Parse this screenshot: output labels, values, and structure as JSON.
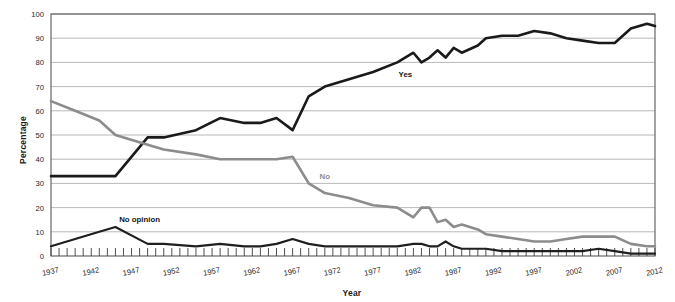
{
  "chart_data": {
    "type": "line",
    "title": "",
    "xlabel": "Year",
    "ylabel": "Percentage",
    "xlim": [
      1937,
      2012
    ],
    "ylim": [
      0,
      100
    ],
    "grid": true,
    "gridlines_axis": "y",
    "legend_position": "inline-annotations",
    "ytick_labels": [
      "0",
      "10",
      "20",
      "30",
      "40",
      "50",
      "60",
      "70",
      "80",
      "90",
      "100"
    ],
    "ytick_values": [
      0,
      10,
      20,
      30,
      40,
      50,
      60,
      70,
      80,
      90,
      100
    ],
    "xtick_labels": [
      "1937",
      "1942",
      "1947",
      "1952",
      "1957",
      "1962",
      "1967",
      "1972",
      "1977",
      "1982",
      "1987",
      "1992",
      "1997",
      "2002",
      "2007",
      "2012"
    ],
    "xtick_values": [
      1937,
      1942,
      1947,
      1952,
      1957,
      1962,
      1967,
      1972,
      1977,
      1982,
      1987,
      1992,
      1997,
      2002,
      2007,
      2012
    ],
    "minor_xticks_every": 1,
    "annotations": [
      {
        "text": "Yes",
        "x": 1981,
        "y": 74,
        "color": "#141414"
      },
      {
        "text": "No",
        "x": 1971,
        "y": 32,
        "color": "#8c8c8c"
      },
      {
        "text": "No opinion",
        "x": 1948,
        "y": 14,
        "color": "#141414"
      }
    ],
    "series": [
      {
        "name": "Yes",
        "color": "#1a1a1a",
        "width": 2.6,
        "x": [
          1937,
          1940,
          1943,
          1945,
          1949,
          1951,
          1955,
          1958,
          1961,
          1963,
          1965,
          1967,
          1969,
          1971,
          1974,
          1977,
          1980,
          1982,
          1983,
          1984,
          1985,
          1986,
          1987,
          1988,
          1990,
          1991,
          1993,
          1995,
          1997,
          1999,
          2001,
          2003,
          2005,
          2007,
          2009,
          2011,
          2012
        ],
        "values": [
          33,
          33,
          33,
          33,
          49,
          49,
          52,
          57,
          55,
          55,
          57,
          52,
          66,
          70,
          73,
          76,
          80,
          84,
          80,
          82,
          85,
          82,
          86,
          84,
          87,
          90,
          91,
          91,
          93,
          92,
          90,
          89,
          88,
          88,
          94,
          96,
          95
        ]
      },
      {
        "name": "No",
        "color": "#8c8c8c",
        "width": 2.6,
        "x": [
          1937,
          1940,
          1943,
          1945,
          1949,
          1951,
          1955,
          1958,
          1961,
          1963,
          1965,
          1967,
          1969,
          1971,
          1974,
          1977,
          1980,
          1982,
          1983,
          1984,
          1985,
          1986,
          1987,
          1988,
          1990,
          1991,
          1993,
          1995,
          1997,
          1999,
          2001,
          2003,
          2005,
          2007,
          2009,
          2011,
          2012
        ],
        "values": [
          64,
          60,
          56,
          50,
          46,
          44,
          42,
          40,
          40,
          40,
          40,
          41,
          30,
          26,
          24,
          21,
          20,
          16,
          20,
          20,
          14,
          15,
          12,
          13,
          11,
          9,
          8,
          7,
          6,
          6,
          7,
          8,
          8,
          8,
          5,
          4,
          4
        ]
      },
      {
        "name": "No opinion",
        "color": "#1f1f1f",
        "width": 2.2,
        "x": [
          1937,
          1940,
          1943,
          1945,
          1949,
          1951,
          1955,
          1958,
          1961,
          1963,
          1965,
          1967,
          1969,
          1971,
          1974,
          1977,
          1980,
          1982,
          1983,
          1984,
          1985,
          1986,
          1987,
          1988,
          1990,
          1991,
          1993,
          1995,
          1997,
          1999,
          2001,
          2003,
          2005,
          2007,
          2009,
          2011,
          2012
        ],
        "values": [
          4,
          7,
          10,
          12,
          5,
          5,
          4,
          5,
          4,
          4,
          5,
          7,
          5,
          4,
          4,
          4,
          4,
          5,
          5,
          4,
          4,
          6,
          4,
          3,
          3,
          3,
          2,
          2,
          2,
          2,
          2,
          2,
          3,
          2,
          1,
          1,
          1
        ]
      }
    ]
  },
  "axis": {
    "y_title": "Percentage",
    "x_title": "Year"
  }
}
